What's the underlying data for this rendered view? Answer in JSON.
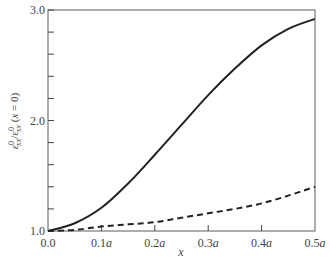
{
  "chart_data": {
    "type": "line",
    "title": "",
    "xlabel": "x",
    "ylabel": "ε⁰xx/ε⁰xx (x = 0)",
    "xlim": [
      0.0,
      0.5
    ],
    "ylim": [
      1.0,
      3.0
    ],
    "x_unit": "a",
    "x_ticks": [
      0.0,
      0.1,
      0.2,
      0.3,
      0.4,
      0.5
    ],
    "x_tick_labels": [
      "0.0",
      "0.1a",
      "0.2a",
      "0.3a",
      "0.4a",
      "0.5a"
    ],
    "y_ticks_major": [
      1.0,
      2.0,
      3.0
    ],
    "y_tick_labels": [
      "1.0",
      "2.0",
      "3.0"
    ],
    "y_ticks_minor_step": 0.2,
    "grid": false,
    "legend": null,
    "x": [
      0.0,
      0.05,
      0.1,
      0.15,
      0.2,
      0.25,
      0.3,
      0.35,
      0.4,
      0.45,
      0.5
    ],
    "series": [
      {
        "name": "solid",
        "style": "solid",
        "color": "#222222",
        "values": [
          1.0,
          1.07,
          1.21,
          1.43,
          1.69,
          1.96,
          2.23,
          2.47,
          2.68,
          2.83,
          2.92
        ]
      },
      {
        "name": "dashed",
        "style": "dashed",
        "color": "#222222",
        "values": [
          1.0,
          1.01,
          1.04,
          1.06,
          1.08,
          1.12,
          1.16,
          1.2,
          1.25,
          1.32,
          1.4
        ]
      }
    ]
  },
  "labels": {
    "xlabel": "x",
    "ylabel_main": "ε",
    "ylabel_full": "ε⁰xx/ε⁰xx (x = 0)"
  }
}
